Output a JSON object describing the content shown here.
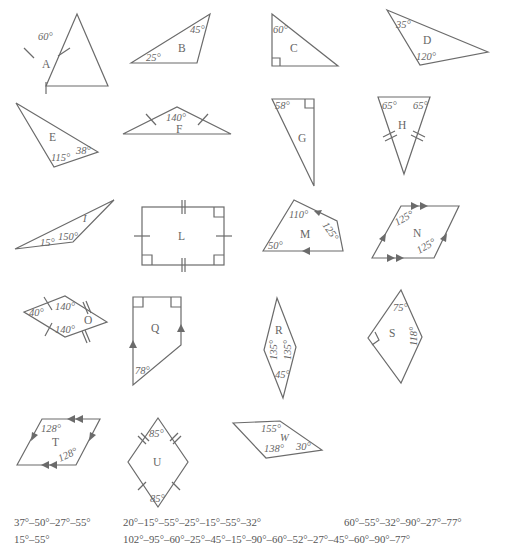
{
  "shapes": {
    "A": {
      "label": "A",
      "angles": [
        "60°"
      ]
    },
    "B": {
      "label": "B",
      "angles": [
        "45°",
        "25°"
      ]
    },
    "C": {
      "label": "C",
      "angles": [
        "60°"
      ]
    },
    "D": {
      "label": "D",
      "angles": [
        "35°",
        "120°"
      ]
    },
    "E": {
      "label": "E",
      "angles": [
        "115°",
        "38°"
      ]
    },
    "F": {
      "label": "F",
      "angles": [
        "140°"
      ]
    },
    "G": {
      "label": "G",
      "angles": [
        "58°"
      ]
    },
    "H": {
      "label": "H",
      "angles": [
        "65°",
        "65°"
      ]
    },
    "I": {
      "label": "I",
      "angles": [
        "15°",
        "150°"
      ]
    },
    "L": {
      "label": "L",
      "angles": []
    },
    "M": {
      "label": "M",
      "angles": [
        "110°",
        "125°",
        "50°"
      ]
    },
    "N": {
      "label": "N",
      "angles": [
        "125°",
        "125°"
      ]
    },
    "O": {
      "label": "O",
      "angles": [
        "40°",
        "140°",
        "140°"
      ]
    },
    "Q": {
      "label": "Q",
      "angles": [
        "78°"
      ]
    },
    "R": {
      "label": "R",
      "angles": [
        "135°",
        "135°",
        "45°"
      ]
    },
    "S": {
      "label": "S",
      "angles": [
        "75°",
        "118°"
      ]
    },
    "T": {
      "label": "T",
      "angles": [
        "128°",
        "128°"
      ]
    },
    "U": {
      "label": "U",
      "angles": [
        "85°",
        "85°"
      ]
    },
    "W": {
      "label": "W",
      "angles": [
        "155°",
        "138°",
        "30°"
      ]
    }
  },
  "answers": {
    "row1": [
      "37°–50°–27°–55°",
      "20°–15°–55°–25°–15°–55°–32°",
      "60°–55°–32°–90°–27°–77°"
    ],
    "row2": [
      "15°–55°",
      "102°–95°–60°–25°–45°–15°–90°–60°–52°–27°–45°–60°–90°–77°"
    ]
  }
}
